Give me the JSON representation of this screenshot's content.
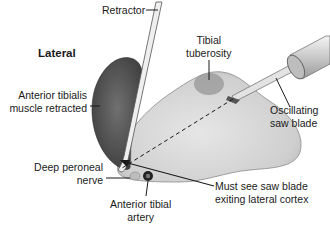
{
  "labels": {
    "lateral": "Lateral",
    "retractor": "Retractor",
    "tibial_tuberosity": [
      "Tibial",
      "tuberosity"
    ],
    "anterior_tibialis": [
      "Anterior tibialis",
      "muscle retracted"
    ],
    "oscillating_saw": [
      "Oscillating",
      "saw blade"
    ],
    "deep_peroneal": [
      "Deep peroneal",
      "nerve"
    ],
    "anterior_tibial_artery": [
      "Anterior tibial",
      "artery"
    ],
    "must_see": [
      "Must see saw blade",
      "exiting lateral cortex"
    ]
  },
  "colors": {
    "muscle": "#5e5e5e",
    "bone": "#d9d9d9",
    "tuberosity": "#9a9a9a",
    "nerve": "#b5b5b5",
    "artery": "#2a2a2a",
    "line": "#1a1a1a"
  }
}
